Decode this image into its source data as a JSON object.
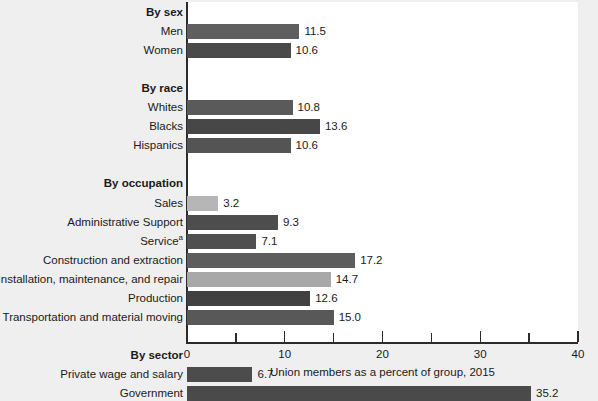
{
  "chart_data": {
    "type": "bar",
    "orientation": "horizontal",
    "title": "",
    "xlabel": "Union members as a percent of group, 2015",
    "ylabel": "",
    "xlim": [
      0,
      40
    ],
    "xticks": [
      0,
      10,
      20,
      30,
      40
    ],
    "xtick_labels": [
      "0",
      "10",
      "20",
      "30",
      "40"
    ],
    "xminor_ticks": [
      5,
      15,
      25,
      35
    ],
    "grid": false,
    "legend": false,
    "footnote_marker": "a",
    "rows": [
      {
        "label": "By sex",
        "group": true,
        "value": null,
        "shade": null
      },
      {
        "label": "Men",
        "group": false,
        "value": 11.5,
        "shade": "#5f5f5f"
      },
      {
        "label": "Women",
        "group": false,
        "value": 10.6,
        "shade": "#4a4a4a"
      },
      {
        "label": "",
        "group": false,
        "value": null,
        "shade": null
      },
      {
        "label": "By race",
        "group": true,
        "value": null,
        "shade": null
      },
      {
        "label": "Whites",
        "group": false,
        "value": 10.8,
        "shade": "#5a5a5a"
      },
      {
        "label": "Blacks",
        "group": false,
        "value": 13.6,
        "shade": "#474747"
      },
      {
        "label": "Hispanics",
        "group": false,
        "value": 10.6,
        "shade": "#545454"
      },
      {
        "label": "",
        "group": false,
        "value": null,
        "shade": null
      },
      {
        "label": "By occupation",
        "group": true,
        "value": null,
        "shade": null
      },
      {
        "label": "Sales",
        "group": false,
        "value": 3.2,
        "shade": "#b6b6b6"
      },
      {
        "label": "Administrative Support",
        "group": false,
        "value": 9.3,
        "shade": "#4d4d4d"
      },
      {
        "label": "Service",
        "group": false,
        "value": 7.1,
        "shade": "#4f4f4f",
        "footnote": "a"
      },
      {
        "label": "Construction and extraction",
        "group": false,
        "value": 17.2,
        "shade": "#5d5d5d"
      },
      {
        "label": "Installation, maintenance, and repair",
        "group": false,
        "value": 14.7,
        "shade": "#a8a8a8"
      },
      {
        "label": "Production",
        "group": false,
        "value": 12.6,
        "shade": "#414141"
      },
      {
        "label": "Transportation and material moving",
        "group": false,
        "value": 15.0,
        "shade": "#585858"
      },
      {
        "label": "",
        "group": false,
        "value": null,
        "shade": null
      },
      {
        "label": "By sector",
        "group": true,
        "value": null,
        "shade": null
      },
      {
        "label": "Private wage and salary",
        "group": false,
        "value": 6.7,
        "shade": "#4c4c4c"
      },
      {
        "label": "Government",
        "group": false,
        "value": 35.2,
        "shade": "#4a4a4a"
      }
    ]
  }
}
